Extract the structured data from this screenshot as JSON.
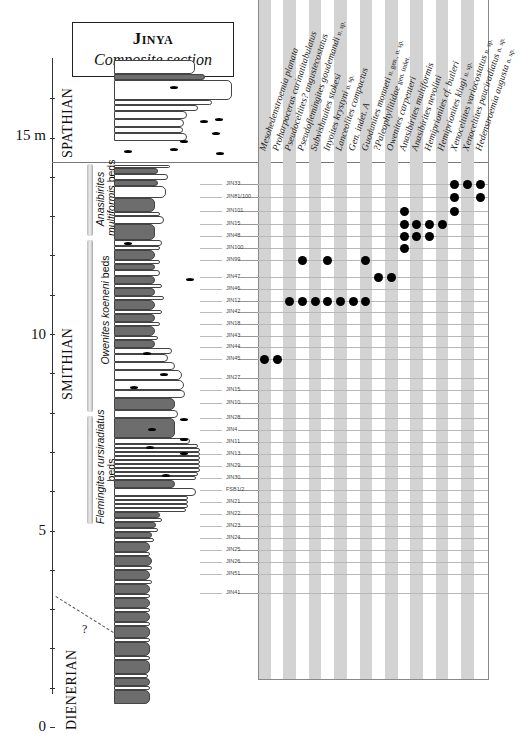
{
  "title": {
    "main": "Jinya",
    "subtitle": "Composite section"
  },
  "scale": {
    "unit": "m",
    "labels": [
      {
        "value": "15 m",
        "y": 136
      },
      {
        "value": "10",
        "y": 335
      },
      {
        "value": "5",
        "y": 531
      },
      {
        "value": "0",
        "y": 727
      }
    ]
  },
  "stages": [
    {
      "name": "SPATHIAN",
      "y_top": 58,
      "y_bottom": 162
    },
    {
      "name": "SMITHIAN",
      "y_top": 162,
      "y_bottom": 604
    },
    {
      "name": "DIENERIAN",
      "y_top": 604,
      "y_bottom": 730
    }
  ],
  "uncertain_boundary_label": "?",
  "beds": [
    {
      "genus": "Anasibirites",
      "species": "multiformis",
      "suffix": "beds",
      "y_top": 162,
      "y_bottom": 237
    },
    {
      "genus": "Owenites",
      "species": "koeneni",
      "suffix": "beds",
      "y_top": 238,
      "y_bottom": 414
    },
    {
      "genus": "Flemingites",
      "species": "rursiradiatus",
      "suffix": "beds",
      "y_top": 415,
      "y_bottom": 525
    }
  ],
  "taxa": [
    {
      "name": "Mesohedenstroemia planata",
      "qualifier": ""
    },
    {
      "name": "Proharpoceras carinatitabulatus",
      "qualifier": ""
    },
    {
      "name": "Pseudoceltites? angustecostatus",
      "qualifier": ""
    },
    {
      "name": "Pseudoflemingites goudemandi",
      "qualifier": "n. sp."
    },
    {
      "name": "Subvishnuites stokesi",
      "qualifier": ""
    },
    {
      "name": "Inyoites krystyni",
      "qualifier": "n. sp."
    },
    {
      "name": "Lanceolites compactus",
      "qualifier": ""
    },
    {
      "name": "Gen. indet. A",
      "qualifier": ""
    },
    {
      "name": "Guodunites monneti",
      "qualifier": "n. gen., n. sp."
    },
    {
      "name": "?Paleophyllitidae",
      "qualifier": "gen. indet."
    },
    {
      "name": "Owenites carpenteri",
      "qualifier": ""
    },
    {
      "name": "Anasibirites multiformis",
      "qualifier": ""
    },
    {
      "name": "Anasibirites nevolini",
      "qualifier": ""
    },
    {
      "name": "Hemiprionites cf. butleri",
      "qualifier": ""
    },
    {
      "name": "Hemiprionites klugi",
      "qualifier": "n. sp."
    },
    {
      "name": "Xenoceltites variocostatus",
      "qualifier": "n. sp."
    },
    {
      "name": "Xenoceltites pauciradiatus",
      "qualifier": "n. sp."
    },
    {
      "name": "Hedenstroemia augusta",
      "qualifier": "n. sp."
    }
  ],
  "samples": [
    {
      "id": "JIN33",
      "y": 184
    },
    {
      "id": "JIN81/100",
      "y": 197
    },
    {
      "id": "JIN101",
      "y": 211
    },
    {
      "id": "JIN15",
      "y": 224
    },
    {
      "id": "JIN48",
      "y": 236
    },
    {
      "id": "JIN100",
      "y": 248
    },
    {
      "id": "JIN99",
      "y": 260
    },
    {
      "id": "JIN47",
      "y": 277
    },
    {
      "id": "JIN46",
      "y": 289
    },
    {
      "id": "JIN12",
      "y": 301
    },
    {
      "id": "JIN42",
      "y": 312
    },
    {
      "id": "JIN18",
      "y": 324
    },
    {
      "id": "JIN43",
      "y": 336
    },
    {
      "id": "JIN44",
      "y": 347
    },
    {
      "id": "JIN45",
      "y": 359
    },
    {
      "id": "JIN27",
      "y": 378
    },
    {
      "id": "JIN15",
      "y": 390
    },
    {
      "id": "JIN10",
      "y": 403
    },
    {
      "id": "JIN28",
      "y": 418
    },
    {
      "id": "JIN4",
      "y": 430
    },
    {
      "id": "JIN11",
      "y": 442
    },
    {
      "id": "JIN13",
      "y": 454
    },
    {
      "id": "JIN29",
      "y": 466
    },
    {
      "id": "JIN30",
      "y": 478
    },
    {
      "id": "FSB1/2",
      "y": 490
    },
    {
      "id": "JIN21",
      "y": 502
    },
    {
      "id": "JIN22",
      "y": 514
    },
    {
      "id": "JIN23",
      "y": 526
    },
    {
      "id": "JIN24",
      "y": 538
    },
    {
      "id": "JIN25",
      "y": 550
    },
    {
      "id": "JIN26",
      "y": 562
    },
    {
      "id": "JIN51",
      "y": 574
    },
    {
      "id": "JIN41",
      "y": 593
    }
  ],
  "chart_data": {
    "type": "table",
    "title": "Jinya Composite section",
    "xlabel": "Ammonoid taxa",
    "ylabel": "Stratigraphic height (m)",
    "ylim": [
      0,
      17
    ],
    "y_ticks": [
      "0",
      "5",
      "10",
      "15 m"
    ],
    "stages": [
      "DIENERIAN",
      "SMITHIAN",
      "SPATHIAN"
    ],
    "beds": [
      "Flemingites rursiradiatus beds",
      "Owenites koeneni beds",
      "Anasibirites multiformis beds"
    ],
    "columns": [
      "Mesohedenstroemia planata",
      "Proharpoceras carinatitabulatus",
      "Pseudoceltites? angustecostatus",
      "Pseudoflemingites goudemandi n. sp.",
      "Subvishnuites stokesi",
      "Inyoites krystyni n. sp.",
      "Lanceolites compactus",
      "Gen. indet. A",
      "Guodunites monneti n. gen., n. sp.",
      "?Paleophyllitidae gen. indet.",
      "Owenites carpenteri",
      "Anasibirites multiformis",
      "Anasibirites nevolini",
      "Hemiprionites cf. butleri",
      "Hemiprionites klugi n. sp.",
      "Xenoceltites variocostatus n. sp.",
      "Xenoceltites pauciradiatus n. sp.",
      "Hedenstroemia augusta n. sp."
    ],
    "occurrences": [
      {
        "sample": "JIN33",
        "taxa_indices": [
          15,
          16,
          17
        ]
      },
      {
        "sample": "JIN81/100",
        "taxa_indices": [
          15,
          17
        ]
      },
      {
        "sample": "JIN101",
        "taxa_indices": [
          11,
          15
        ]
      },
      {
        "sample": "JIN15",
        "taxa_indices": [
          11,
          12,
          13,
          14
        ]
      },
      {
        "sample": "JIN48",
        "taxa_indices": [
          11,
          12,
          13
        ]
      },
      {
        "sample": "JIN100",
        "taxa_indices": [
          11
        ]
      },
      {
        "sample": "JIN99",
        "taxa_indices": [
          3,
          5,
          8
        ]
      },
      {
        "sample": "JIN47",
        "taxa_indices": [
          9,
          10
        ]
      },
      {
        "sample": "JIN12",
        "taxa_indices": [
          2,
          3,
          4,
          5,
          6,
          7,
          8
        ]
      },
      {
        "sample": "JIN45",
        "taxa_indices": [
          0,
          1
        ]
      }
    ],
    "grid": true
  },
  "colors": {
    "stripe": "#d3d3d3",
    "dot": "#000000",
    "dark_lithology": "#6d6d6d",
    "grid_line": "#b8b8b8"
  }
}
